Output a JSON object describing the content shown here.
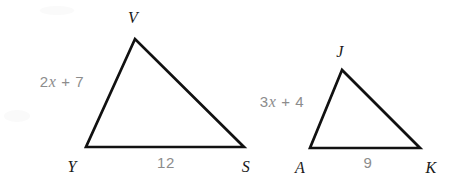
{
  "figure": {
    "background_color": "#ffffff",
    "stroke_color": "#111111",
    "vertex_label_color": "#1a1a1a",
    "measure_label_color": "#8c8c8c",
    "stroke_width": 2.6,
    "triangles": [
      {
        "name": "triangle-vys",
        "vertices": [
          {
            "label": "V",
            "x": 135,
            "y": 39,
            "label_x": 133,
            "label_y": 18
          },
          {
            "label": "Y",
            "x": 86,
            "y": 147,
            "label_x": 72,
            "label_y": 167
          },
          {
            "label": "S",
            "x": 244,
            "y": 147,
            "label_x": 246,
            "label_y": 167
          }
        ],
        "side_labels": [
          {
            "name": "side-yv-label",
            "text_prefix": "2",
            "text_var": "x",
            "text_suffix": " + 7",
            "full_text": "2x + 7",
            "x": 62,
            "y": 82
          },
          {
            "name": "side-ys-label",
            "text": "12",
            "x": 166,
            "y": 162
          }
        ]
      },
      {
        "name": "triangle-jak",
        "vertices": [
          {
            "label": "J",
            "x": 342,
            "y": 70,
            "label_x": 340,
            "label_y": 52
          },
          {
            "label": "A",
            "x": 310,
            "y": 148,
            "label_x": 300,
            "label_y": 168
          },
          {
            "label": "K",
            "x": 420,
            "y": 148,
            "label_x": 431,
            "label_y": 168
          }
        ],
        "side_labels": [
          {
            "name": "side-aj-label",
            "text_prefix": "3",
            "text_var": "x",
            "text_suffix": " + 4",
            "full_text": "3x + 4",
            "x": 282,
            "y": 102
          },
          {
            "name": "side-ak-label",
            "text": "9",
            "x": 368,
            "y": 162
          }
        ]
      }
    ]
  }
}
